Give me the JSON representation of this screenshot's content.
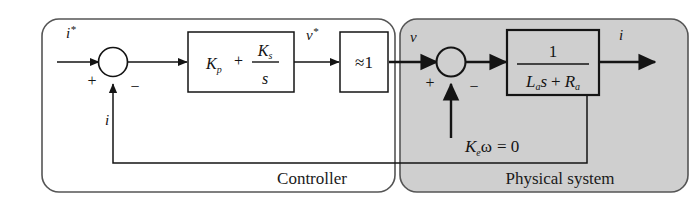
{
  "diagram": {
    "type": "control-block-diagram",
    "sections": [
      {
        "id": "controller",
        "caption": "Controller",
        "fill": "#ffffff",
        "stroke": "#555555"
      },
      {
        "id": "physical-system",
        "caption": "Physical system",
        "fill": "#cfcfcf",
        "stroke": "#555555"
      }
    ],
    "signals": {
      "reference_input": "i*",
      "controller_output": "ν*",
      "plant_input": "ν",
      "plant_output": "i",
      "feedback": "i",
      "disturbance": "Kₑω = 0"
    },
    "signal_parts": {
      "reference_base": "i",
      "reference_star": "*",
      "nu_star_base": "ν",
      "nu_star_star": "*",
      "nu_base": "ν",
      "output_current": "i",
      "feedback_current": "i",
      "disturbance_k": "K",
      "disturbance_k_sub": "e",
      "disturbance_omega": "ω",
      "disturbance_eq": "= 0"
    },
    "blocks": [
      {
        "id": "pi-controller",
        "label": "Kₚ + Kᵢ/s",
        "numerator": "K",
        "numerator_sub": "i",
        "denominator": "s",
        "proportional": "K",
        "proportional_sub": "p",
        "plus": "+",
        "fill": "#ffffff"
      },
      {
        "id": "approx-unity-gain",
        "label": "≈1",
        "fill": "#ffffff"
      },
      {
        "id": "plant-transfer-function",
        "label": "1 / (Lₐs + Rₐ)",
        "numerator": "1",
        "den_l": "L",
        "den_l_sub": "a",
        "den_s": "s",
        "den_plus": "+",
        "den_r": "R",
        "den_r_sub": "a",
        "fill": "#cfcfcf"
      }
    ],
    "summing_junctions": [
      {
        "id": "controller-sum",
        "sign_left": "+",
        "sign_bottom": "−"
      },
      {
        "id": "plant-sum",
        "sign_left": "+",
        "sign_bottom": "−"
      }
    ],
    "colors": {
      "line": "#141414",
      "section_stroke": "#555555",
      "physical_fill": "#cfcfcf",
      "controller_fill": "#ffffff",
      "background": "#ffffff"
    }
  }
}
